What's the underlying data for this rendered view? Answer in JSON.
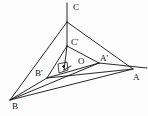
{
  "figure": {
    "kind": "geometry-diagram",
    "background_color": "#fdfdfd",
    "stroke_color": "#111111",
    "width": 148,
    "height": 116
  },
  "labels": [
    {
      "key": "C",
      "text": "C",
      "x": 73,
      "y": 3
    },
    {
      "key": "Cp",
      "text": "C'",
      "x": 71,
      "y": 38
    },
    {
      "key": "O",
      "text": "O",
      "x": 78,
      "y": 57
    },
    {
      "key": "Ap",
      "text": "A'",
      "x": 100,
      "y": 54
    },
    {
      "key": "A",
      "text": "A",
      "x": 133,
      "y": 73
    },
    {
      "key": "Bp",
      "text": "B'",
      "x": 35,
      "y": 69
    },
    {
      "key": "B",
      "text": "B",
      "x": 12,
      "y": 102
    }
  ],
  "points": {
    "C": {
      "x": 67,
      "y": 22
    },
    "C_top": {
      "x": 67,
      "y": 3
    },
    "Cp": {
      "x": 67,
      "y": 46
    },
    "A": {
      "x": 133,
      "y": 69
    },
    "Ap": {
      "x": 99,
      "y": 63
    },
    "B": {
      "x": 10,
      "y": 100
    },
    "Bp": {
      "x": 47,
      "y": 78
    },
    "O": {
      "x": 71,
      "y": 66
    },
    "Foot": {
      "x": 64,
      "y": 70
    },
    "A_ext": {
      "x": 147,
      "y": 68
    }
  },
  "segments": [
    {
      "name": "segment-c-stub",
      "from": "C_top",
      "to": "C"
    },
    {
      "name": "segment-c-to-a",
      "from": "C",
      "to": "A"
    },
    {
      "name": "segment-c-to-b",
      "from": "C",
      "to": "B"
    },
    {
      "name": "segment-c-to-cprime",
      "from": "C",
      "to": "Cp"
    },
    {
      "name": "segment-a-to-b",
      "from": "A",
      "to": "B"
    },
    {
      "name": "segment-cprime-to-aprime",
      "from": "Cp",
      "to": "Ap"
    },
    {
      "name": "segment-cprime-to-bprime",
      "from": "Cp",
      "to": "Bp"
    },
    {
      "name": "segment-aprime-to-bprime",
      "from": "Ap",
      "to": "Bp"
    },
    {
      "name": "segment-bprime-to-a",
      "from": "Bp",
      "to": "A"
    },
    {
      "name": "segment-b-to-bprime",
      "from": "B",
      "to": "Bp"
    },
    {
      "name": "segment-b-to-aprime",
      "from": "B",
      "to": "Ap"
    },
    {
      "name": "segment-aprime-to-aext",
      "from": "Ap",
      "to": "A_ext"
    },
    {
      "name": "segment-cprime-to-foot",
      "from": "Cp",
      "to": "Foot"
    },
    {
      "name": "segment-o-to-foot",
      "from": "O",
      "to": "Foot"
    }
  ],
  "right_angle_marker": {
    "name": "right-angle-square",
    "corner_x": 58,
    "corner_y": 64,
    "size": 9
  }
}
